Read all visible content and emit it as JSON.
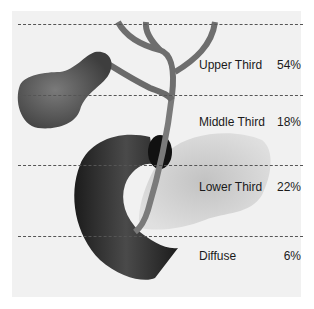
{
  "diagram": {
    "regions": [
      {
        "label": "Upper Third",
        "percent": "54%"
      },
      {
        "label": "Middle Third",
        "percent": "18%"
      },
      {
        "label": "Lower Third",
        "percent": "22%"
      },
      {
        "label": "Diffuse",
        "percent": "6%"
      }
    ],
    "colors": {
      "background": "#f1f1f1",
      "duct": "#6e6e6e",
      "gallbladder": "#5e5e5e",
      "duodenum": "#2a2a2a",
      "pancreas": "#cfcfcf",
      "dash": "#555555",
      "text": "#1a1a1a"
    }
  }
}
